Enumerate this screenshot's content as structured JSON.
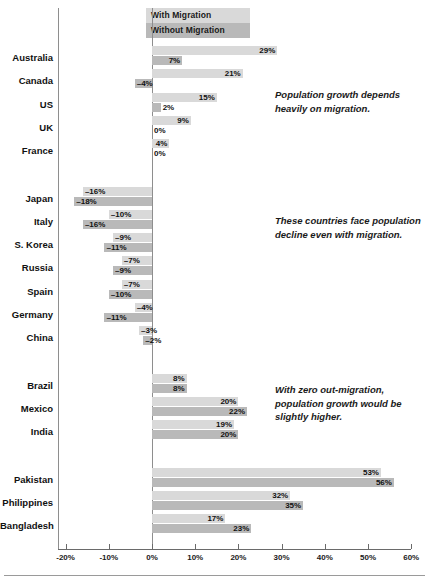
{
  "chart_data": {
    "type": "bar",
    "orientation": "horizontal",
    "title": "",
    "xlabel": "",
    "ylabel": "",
    "xlim": [
      -20,
      60
    ],
    "grid": false,
    "legend_position": "top-center",
    "legend": [
      {
        "name": "With Migration",
        "color": "#d9d9d9"
      },
      {
        "name": "Without Migration",
        "color": "#b9b9b9"
      }
    ],
    "tick_labels": [
      "-20%",
      "-10%",
      "0%",
      "10%",
      "20%",
      "30%",
      "40%",
      "50%",
      "60%"
    ],
    "tick_values": [
      -20,
      -10,
      0,
      10,
      20,
      30,
      40,
      50,
      60
    ],
    "categories": [
      "Australia",
      "Canada",
      "US",
      "UK",
      "France",
      "Japan",
      "Italy",
      "S. Korea",
      "Russia",
      "Spain",
      "Germany",
      "China",
      "Brazil",
      "Mexico",
      "India",
      "Pakistan",
      "Philippines",
      "Bangladesh"
    ],
    "series": [
      {
        "name": "With Migration",
        "values": [
          29,
          21,
          15,
          9,
          4,
          -16,
          -10,
          -9,
          -7,
          -7,
          -4,
          -3,
          8,
          20,
          19,
          53,
          32,
          17
        ],
        "labels": [
          "29%",
          "21%",
          "15%",
          "9%",
          "4%",
          "–16%",
          "–10%",
          "–9%",
          "–7%",
          "–7%",
          "–4%",
          "–3%",
          "8%",
          "20%",
          "19%",
          "53%",
          "32%",
          "17%"
        ]
      },
      {
        "name": "Without Migration",
        "values": [
          7,
          -4,
          2,
          0,
          0,
          -18,
          -16,
          -11,
          -9,
          -10,
          -11,
          -2,
          8,
          22,
          20,
          56,
          35,
          23
        ],
        "labels": [
          "7%",
          "–4%",
          "2%",
          "0%",
          "0%",
          "–18%",
          "–16%",
          "–11%",
          "–9%",
          "–10%",
          "–11%",
          "–2%",
          "8%",
          "22%",
          "20%",
          "56%",
          "35%",
          "23%"
        ]
      }
    ],
    "groups": [
      {
        "name": "growth-with-migration",
        "categories": [
          "Australia",
          "Canada",
          "US",
          "UK",
          "France"
        ]
      },
      {
        "name": "population-decline",
        "categories": [
          "Japan",
          "Italy",
          "S. Korea",
          "Russia",
          "Spain",
          "Germany",
          "China"
        ]
      },
      {
        "name": "moderate-growth",
        "categories": [
          "Brazil",
          "Mexico",
          "India"
        ]
      },
      {
        "name": "high-growth",
        "categories": [
          "Pakistan",
          "Philippines",
          "Bangladesh"
        ]
      }
    ],
    "annotations": [
      {
        "id": "annotation-1",
        "text": "Population growth depends heavily on migration."
      },
      {
        "id": "annotation-2",
        "text": "These countries face population decline even with migration."
      },
      {
        "id": "annotation-3",
        "text": "With zero out-migration, population growth would be slightly higher."
      }
    ]
  },
  "colors": {
    "with_migration": "#d9d9d9",
    "without_migration": "#b9b9b9",
    "axis": "#8e8e8e",
    "text": "#111111",
    "background": "#ffffff"
  }
}
